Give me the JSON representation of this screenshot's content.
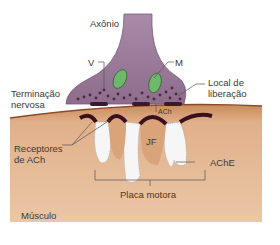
{
  "diagram": {
    "labels": {
      "axon": "Axônio",
      "vesicle": "V",
      "mitochondrion": "M",
      "nerve_terminal_1": "Terminação",
      "nerve_terminal_2": "nervosa",
      "release_site_1": "Local de",
      "release_site_2": "liberação",
      "ach": "ACh",
      "ach_receptors_1": "Receptores",
      "ach_receptors_2": "de ACh",
      "junctional_fold": "JF",
      "ache": "AChE",
      "endplate": "Placa motora",
      "muscle": "Músculo"
    },
    "colors": {
      "terminal": "#9a7a98",
      "terminal_dark": "#7a5a78",
      "vesicle": "#4a2a40",
      "mitochondrion": "#6db86a",
      "release_zone": "#3a1a2a",
      "muscle": "#e2b48c",
      "muscle_dark": "#c98a5a",
      "fold_cleft": "#f4f4f4",
      "receptor_band": "#3a1020"
    }
  }
}
